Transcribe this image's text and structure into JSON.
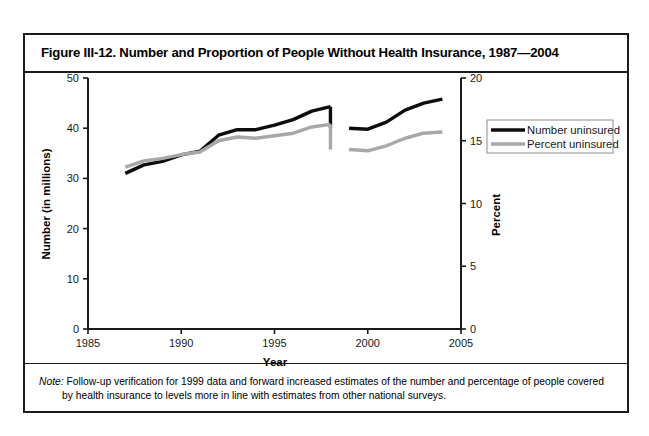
{
  "figure": {
    "title": "Figure III-12. Number and Proportion of People Without Health Insurance, 1987—2004",
    "note_label": "Note:",
    "note_line1": " Follow-up verification for 1999 data and forward increased estimates of the number and percentage of people covered",
    "note_line2": "by health insurance to levels more in line with estimates from other national surveys."
  },
  "colors": {
    "number_series": "#0d0d0d",
    "percent_series": "#a8a8a8",
    "frame": "#1a1a1a",
    "background": "#ffffff"
  },
  "chart_data": {
    "type": "line",
    "title": "Figure III-12. Number and Proportion of People Without Health Insurance, 1987—2004",
    "xlabel": "Year",
    "ylabel": "Number (in millions)",
    "y2label": "Percent",
    "xlim": [
      1985,
      2005
    ],
    "ylim": [
      0,
      50
    ],
    "y2lim": [
      0,
      20
    ],
    "xticks": [
      1985,
      1990,
      1995,
      2000,
      2005
    ],
    "xticklabels": [
      "1985",
      "1990",
      "1995",
      "2000",
      "2005"
    ],
    "yticks": [
      0,
      10,
      20,
      30,
      40,
      50
    ],
    "yticklabels": [
      "0",
      "10",
      "20",
      "30",
      "40",
      "50"
    ],
    "y2ticks": [
      0,
      5,
      10,
      15,
      20
    ],
    "y2ticklabels": [
      "0",
      "5",
      "10",
      "15",
      "20"
    ],
    "grid": false,
    "legend_position": "right",
    "x": [
      1987,
      1988,
      1989,
      1990,
      1991,
      1992,
      1993,
      1994,
      1995,
      1996,
      1997,
      1998,
      1999,
      2000,
      2001,
      2002,
      2003,
      2004
    ],
    "series": [
      {
        "name": "Number uninsured",
        "axis": "left",
        "unit": "millions",
        "color": "#0d0d0d",
        "values": [
          31.0,
          32.7,
          33.4,
          34.7,
          35.4,
          38.6,
          39.7,
          39.7,
          40.6,
          41.7,
          43.4,
          44.3,
          40.0,
          39.8,
          41.2,
          43.6,
          45.0,
          45.8
        ],
        "break_after_year": 1998,
        "break_note": "Series discontinuity between 1998 and 1999 due to survey verification change"
      },
      {
        "name": "Percent uninsured",
        "axis": "right",
        "unit": "percent",
        "color": "#a8a8a8",
        "values": [
          12.9,
          13.4,
          13.6,
          13.9,
          14.1,
          15.0,
          15.3,
          15.2,
          15.4,
          15.6,
          16.1,
          16.3,
          14.3,
          14.2,
          14.6,
          15.2,
          15.6,
          15.7
        ],
        "break_after_year": 1998,
        "break_note": "Series discontinuity between 1998 and 1999 due to survey verification change"
      }
    ],
    "legend": [
      {
        "label": "Number uninsured",
        "color": "#0d0d0d"
      },
      {
        "label": "Percent uninsured",
        "color": "#a8a8a8"
      }
    ]
  }
}
